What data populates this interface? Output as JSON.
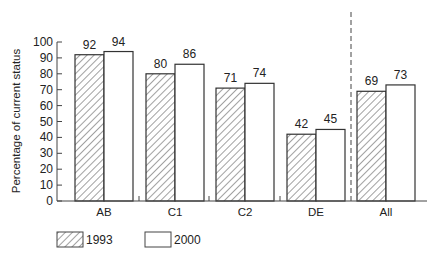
{
  "chart_data": {
    "type": "bar",
    "title": "",
    "xlabel": "",
    "ylabel": "Percentage of current status",
    "ylim": [
      0,
      100
    ],
    "yticks": [
      0,
      10,
      20,
      30,
      40,
      50,
      60,
      70,
      80,
      90,
      100
    ],
    "categories": [
      "AB",
      "C1",
      "C2",
      "DE",
      "All"
    ],
    "series": [
      {
        "name": "1993",
        "pattern": "hatched",
        "values": [
          92,
          80,
          71,
          42,
          69
        ]
      },
      {
        "name": "2000",
        "pattern": "white",
        "values": [
          94,
          86,
          74,
          45,
          73
        ]
      }
    ],
    "annotations": [
      "dashed vertical separator between DE and All"
    ],
    "legend_position": "bottom-left",
    "grid": false
  },
  "legend": {
    "items": [
      {
        "label": "1993"
      },
      {
        "label": "2000"
      }
    ]
  },
  "colors": {
    "stroke": "#333333",
    "background": "#ffffff"
  }
}
